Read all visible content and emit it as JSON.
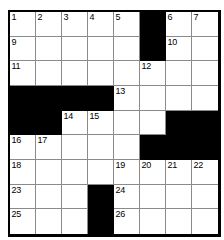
{
  "puzzle": {
    "title": "Crossword Grid",
    "columns": 8,
    "rows": 9,
    "colors": {
      "block": "#000000",
      "cell": "#ffffff",
      "gridline": "#8a8a8a",
      "border": "#000000",
      "number_text": "#000000"
    },
    "grid": [
      [
        {
          "type": "open",
          "number": "1"
        },
        {
          "type": "open",
          "number": "2"
        },
        {
          "type": "open",
          "number": "3"
        },
        {
          "type": "open",
          "number": "4"
        },
        {
          "type": "open",
          "number": "5"
        },
        {
          "type": "block",
          "number": ""
        },
        {
          "type": "open",
          "number": "6"
        },
        {
          "type": "open",
          "number": "7"
        },
        {
          "type": "open",
          "number": "8"
        }
      ],
      [
        {
          "type": "open",
          "number": "9"
        },
        {
          "type": "open",
          "number": ""
        },
        {
          "type": "open",
          "number": ""
        },
        {
          "type": "open",
          "number": ""
        },
        {
          "type": "open",
          "number": ""
        },
        {
          "type": "block",
          "number": ""
        },
        {
          "type": "open",
          "number": "10"
        },
        {
          "type": "open",
          "number": ""
        },
        {
          "type": "open",
          "number": ""
        }
      ],
      [
        {
          "type": "open",
          "number": "11"
        },
        {
          "type": "open",
          "number": ""
        },
        {
          "type": "open",
          "number": ""
        },
        {
          "type": "open",
          "number": ""
        },
        {
          "type": "open",
          "number": ""
        },
        {
          "type": "open",
          "number": "12"
        },
        {
          "type": "open",
          "number": ""
        },
        {
          "type": "open",
          "number": ""
        }
      ],
      [
        {
          "type": "block",
          "number": ""
        },
        {
          "type": "block",
          "number": ""
        },
        {
          "type": "block",
          "number": ""
        },
        {
          "type": "block",
          "number": ""
        },
        {
          "type": "open",
          "number": "13"
        },
        {
          "type": "open",
          "number": ""
        },
        {
          "type": "open",
          "number": ""
        },
        {
          "type": "open",
          "number": ""
        }
      ],
      [
        {
          "type": "block",
          "number": ""
        },
        {
          "type": "block",
          "number": ""
        },
        {
          "type": "open",
          "number": "14"
        },
        {
          "type": "open",
          "number": "15"
        },
        {
          "type": "open",
          "number": ""
        },
        {
          "type": "open",
          "number": ""
        },
        {
          "type": "block",
          "number": ""
        },
        {
          "type": "block",
          "number": ""
        }
      ],
      [
        {
          "type": "open",
          "number": "16"
        },
        {
          "type": "open",
          "number": "17"
        },
        {
          "type": "open",
          "number": ""
        },
        {
          "type": "open",
          "number": ""
        },
        {
          "type": "open",
          "number": ""
        },
        {
          "type": "block",
          "number": ""
        },
        {
          "type": "block",
          "number": ""
        },
        {
          "type": "block",
          "number": ""
        }
      ],
      [
        {
          "type": "open",
          "number": "18"
        },
        {
          "type": "open",
          "number": ""
        },
        {
          "type": "open",
          "number": ""
        },
        {
          "type": "open",
          "number": ""
        },
        {
          "type": "open",
          "number": "19"
        },
        {
          "type": "open",
          "number": "20"
        },
        {
          "type": "open",
          "number": "21"
        },
        {
          "type": "open",
          "number": "22"
        }
      ],
      [
        {
          "type": "open",
          "number": "23"
        },
        {
          "type": "open",
          "number": ""
        },
        {
          "type": "open",
          "number": ""
        },
        {
          "type": "block",
          "number": ""
        },
        {
          "type": "open",
          "number": "24"
        },
        {
          "type": "open",
          "number": ""
        },
        {
          "type": "open",
          "number": ""
        },
        {
          "type": "open",
          "number": ""
        }
      ],
      [
        {
          "type": "open",
          "number": "25"
        },
        {
          "type": "open",
          "number": ""
        },
        {
          "type": "open",
          "number": ""
        },
        {
          "type": "block",
          "number": ""
        },
        {
          "type": "open",
          "number": "26"
        },
        {
          "type": "open",
          "number": ""
        },
        {
          "type": "open",
          "number": ""
        },
        {
          "type": "open",
          "number": ""
        }
      ]
    ]
  }
}
